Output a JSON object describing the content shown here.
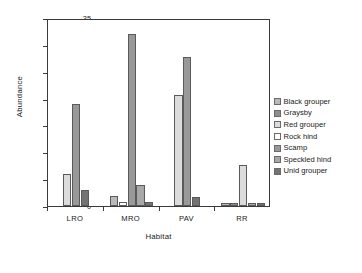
{
  "chart_data": {
    "type": "bar",
    "title": "",
    "xlabel": "Habitat",
    "ylabel": "Abundance",
    "categories": [
      "LRO",
      "MRO",
      "PAV",
      "RR"
    ],
    "ylim": [
      0,
      35
    ],
    "yticks": [
      0,
      5,
      10,
      15,
      20,
      25,
      30,
      35
    ],
    "grid": false,
    "legend_position": "right",
    "series": [
      {
        "name": "Black grouper",
        "color": "#b9b9b9",
        "values": [
          0,
          1.8,
          0,
          0.6
        ]
      },
      {
        "name": "Graysby",
        "color": "#8e8e8e",
        "values": [
          0,
          0,
          0,
          0.6
        ]
      },
      {
        "name": "Red grouper",
        "color": "#dcdcdc",
        "values": [
          5.9,
          0,
          20.7,
          7.7
        ]
      },
      {
        "name": "Rock hind",
        "color": "#ffffff",
        "values": [
          0,
          0.8,
          0,
          0
        ]
      },
      {
        "name": "Scamp",
        "color": "#999999",
        "values": [
          19.0,
          32.0,
          27.7,
          0
        ]
      },
      {
        "name": "Speckled hind",
        "color": "#a8a8a8",
        "values": [
          0,
          3.9,
          0,
          0.6
        ]
      },
      {
        "name": "Unid grouper",
        "color": "#737373",
        "values": [
          2.9,
          0.8,
          1.7,
          0.6
        ]
      }
    ]
  },
  "axis": {
    "y_label": "Abundance",
    "x_label": "Habitat",
    "y_tick_labels": [
      "0",
      "5",
      "10",
      "15",
      "20",
      "25",
      "30",
      "35"
    ],
    "x_tick_labels": [
      "LRO",
      "MRO",
      "PAV",
      "RR"
    ]
  },
  "legend": {
    "items": [
      {
        "label": "Black grouper"
      },
      {
        "label": "Graysby"
      },
      {
        "label": "Red grouper"
      },
      {
        "label": "Rock hind"
      },
      {
        "label": "Scamp"
      },
      {
        "label": "Speckled hind"
      },
      {
        "label": "Unid grouper"
      }
    ]
  }
}
